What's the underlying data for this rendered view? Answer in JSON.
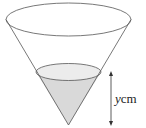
{
  "diagram": {
    "type": "inverted-cone-with-liquid",
    "colors": {
      "stroke": "#555555",
      "liquid_fill": "#d9d9d9",
      "liquid_surface_fill": "#ececec",
      "arrow": "#333333",
      "background": "#ffffff"
    },
    "label": {
      "variable": "y",
      "unit": "cm"
    }
  }
}
